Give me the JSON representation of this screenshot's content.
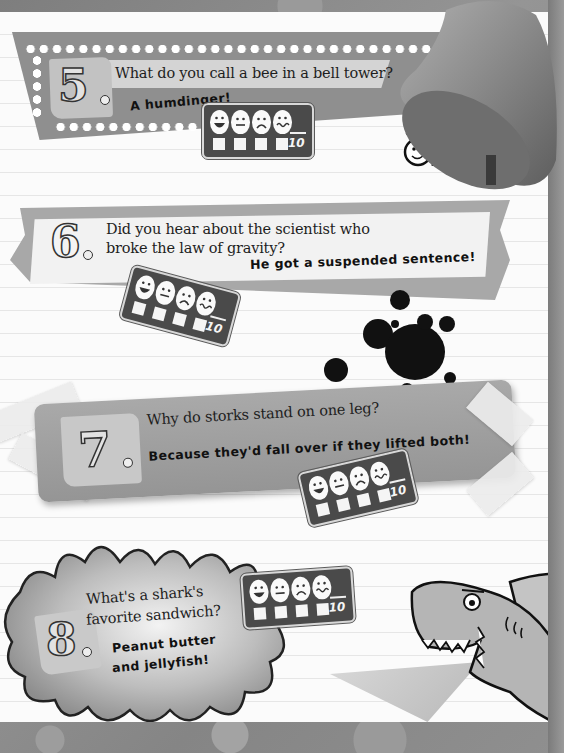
{
  "page": {
    "palette": {
      "background": "#8a8a8a",
      "paper": "#fbfbfb",
      "banner_dark": "#8f8f8f",
      "banner_light": "#d4d4d4",
      "board": "#4a4a4a",
      "ink": "#111111"
    }
  },
  "jokes": [
    {
      "number": "5",
      "question": "What do you call a bee in a bell tower?",
      "answer": "A humdinger!",
      "rating": {
        "faces": [
          "laughing-face",
          "neutral-face",
          "sad-face",
          "queasy-face"
        ],
        "score_max": "10"
      }
    },
    {
      "number": "6",
      "question_line1": "Did you hear about the scientist who",
      "question_line2": "broke the law of gravity?",
      "answer": "He got a suspended sentence!",
      "rating": {
        "faces": [
          "laughing-face",
          "neutral-face",
          "sad-face",
          "queasy-face"
        ],
        "score_max": "10"
      }
    },
    {
      "number": "7",
      "question": "Why do storks stand on one leg?",
      "answer": "Because they'd fall over if they lifted both!",
      "rating": {
        "faces": [
          "laughing-face",
          "neutral-face",
          "sad-face",
          "queasy-face"
        ],
        "score_max": "10"
      }
    },
    {
      "number": "8",
      "question_line1": "What's a shark's",
      "question_line2": "favorite sandwich?",
      "answer_line1": "Peanut butter",
      "answer_line2": "and jellyfish!",
      "rating": {
        "faces": [
          "laughing-face",
          "neutral-face",
          "sad-face",
          "queasy-face"
        ],
        "score_max": "10"
      }
    }
  ]
}
